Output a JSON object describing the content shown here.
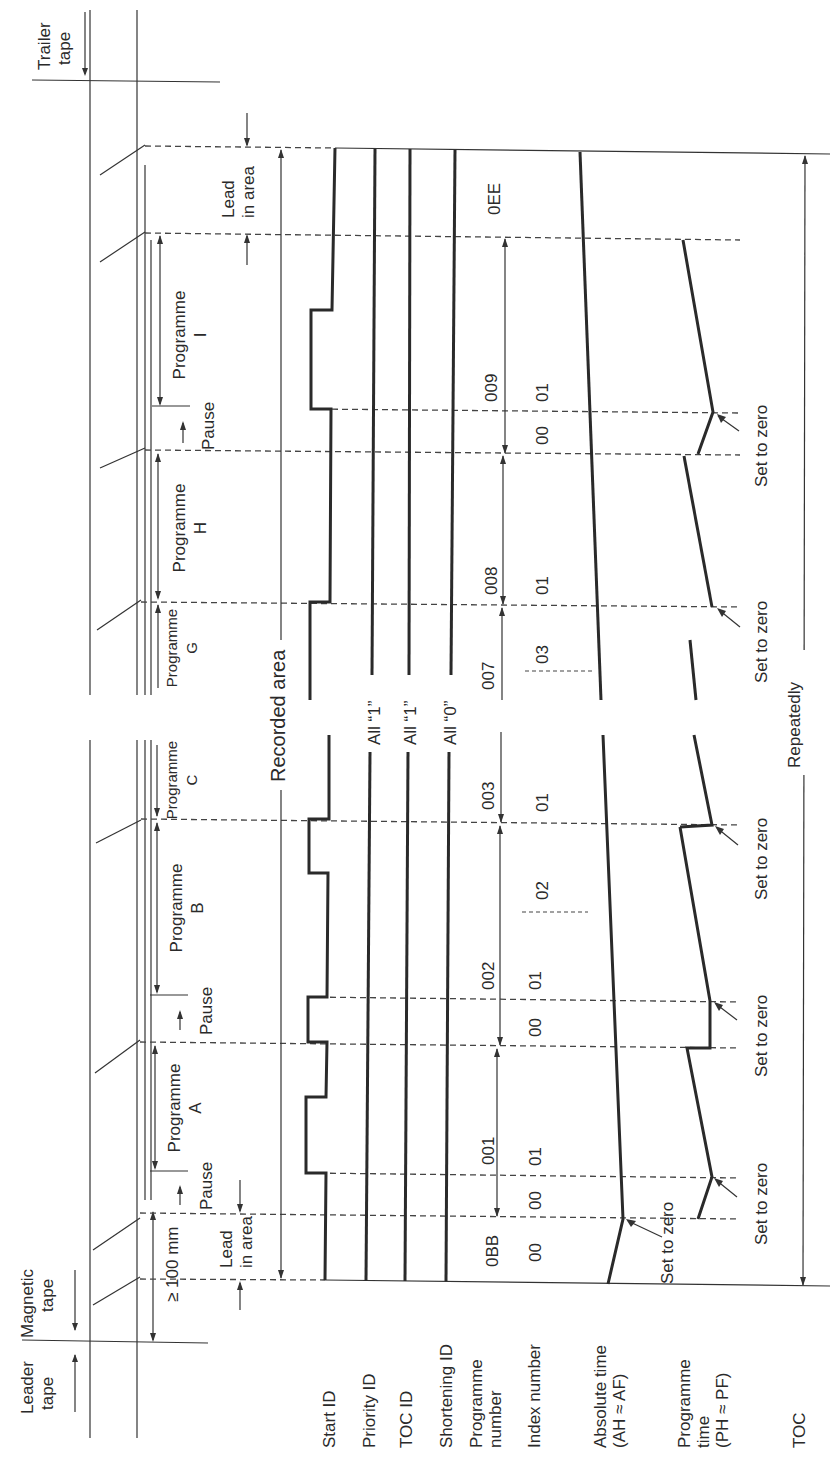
{
  "diagram": {
    "orientation": "rotated 90° counter-clockwise; text reads bottom-to-top",
    "tape_labels": {
      "leader": [
        "Leader",
        "tape"
      ],
      "magnetic": [
        "Magnetic",
        "tape"
      ],
      "trailer": [
        "Trailer",
        "tape"
      ]
    },
    "dimension_label": "≥ 100 mm",
    "lead_in_label": [
      "Lead",
      "in area"
    ],
    "lead_in_label_top": [
      "Lead",
      "in area"
    ],
    "pause_label": "Pause",
    "recorded_area_label": "Recorded area",
    "repeatedly_label": "Repeatedly",
    "set_to_zero_label": "Set to zero",
    "programmes": [
      {
        "label": "Programme",
        "letter": "A"
      },
      {
        "label": "Programme",
        "letter": "B"
      },
      {
        "label": "Programme",
        "letter": "C"
      },
      {
        "label": "Programme",
        "letter": "G"
      },
      {
        "label": "Programme",
        "letter": "H"
      },
      {
        "label": "Programme",
        "letter": "I"
      }
    ],
    "row_labels": {
      "start_id": "Start ID",
      "priority_id": "Priority ID",
      "toc_id": "TOC ID",
      "shortening_id": "Shortening ID",
      "programme_number": [
        "Programme",
        "number"
      ],
      "index_number": "Index number",
      "absolute_time": [
        "Absolute time",
        "(AH ≈ AF)"
      ],
      "programme_time": [
        "Programme",
        "time",
        "(PH ≈ PF)"
      ],
      "toc": "TOC"
    },
    "break_labels": {
      "priority": "All “1”",
      "toc": "All “1”",
      "shortening": "All “0”"
    },
    "programme_numbers": [
      "0BB",
      "001",
      "002",
      "003",
      "007",
      "008",
      "009",
      "0EE"
    ],
    "index_numbers": {
      "lead_in": "00",
      "prog_a": [
        "00",
        "01"
      ],
      "prog_b": [
        "00",
        "01",
        "02"
      ],
      "prog_c": "01",
      "prog_g": "03",
      "prog_h": "01",
      "prog_i": [
        "00",
        "01"
      ]
    }
  }
}
